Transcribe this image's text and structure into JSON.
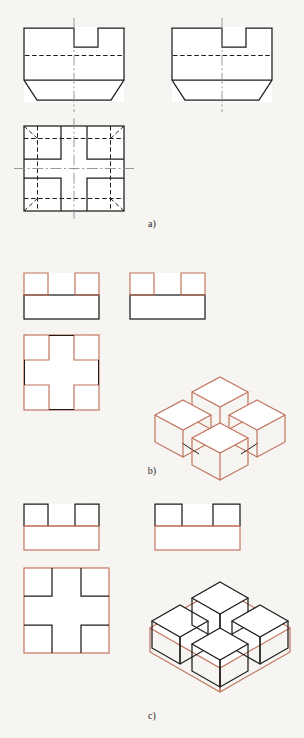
{
  "figure": {
    "background_color": "#f7f5f1",
    "line_color_solid": "#1d1d1d",
    "line_color_red": "#c0705c",
    "line_color_centerline": "#8c8c8c",
    "width": 304,
    "height": 738
  },
  "captions": {
    "a": "a)",
    "b": "b)",
    "c": "c)"
  },
  "panels": [
    {
      "id": "a",
      "label": "a)",
      "description": "Three orthographic views of a slotted chamfered block drawn in black with dashed hidden lines and dash-dot centrelines",
      "views": [
        {
          "name": "front-view",
          "position": "top-left",
          "style": "solid-black",
          "features": [
            "rectangular body",
            "central rectangular slot at top",
            "dashed hidden line across width",
            "chamfered lower corners",
            "vertical dash-dot centreline"
          ]
        },
        {
          "name": "side-view",
          "position": "top-right",
          "style": "solid-black",
          "features": [
            "rectangular body",
            "central rectangular slot at top",
            "dashed hidden line across width",
            "chamfered lower corners",
            "vertical dash-dot centreline"
          ]
        },
        {
          "name": "top-view",
          "position": "middle-left",
          "style": "solid-black",
          "features": [
            "square outline",
            "cross shaped solid cut lines",
            "dashed hidden chamfer lines at four corners",
            "horizontal and vertical dash-dot centrelines"
          ]
        }
      ]
    },
    {
      "id": "b",
      "label": "b)",
      "description": "Solution b: four cubes standing on top of a base slab; cubes drawn in red, base slab outline in black",
      "views": [
        {
          "name": "front-view",
          "position": "left",
          "style": "red-top-black-base",
          "features": [
            "two raised blocks on top",
            "solid base slab"
          ]
        },
        {
          "name": "side-view",
          "position": "right",
          "style": "red-top-black-base",
          "features": [
            "two raised blocks on top",
            "solid base slab"
          ]
        },
        {
          "name": "top-view",
          "position": "lower-left",
          "style": "red-outline-black-cross",
          "features": [
            "square with cross shaped channel"
          ]
        },
        {
          "name": "isometric-view",
          "position": "lower-right",
          "style": "red",
          "features": [
            "four cubes in diamond arrangement",
            "rear cube",
            "left cube",
            "right cube",
            "front cube"
          ]
        }
      ],
      "cube_count": 4
    },
    {
      "id": "c",
      "label": "c)",
      "description": "Solution c: a base slab with four cubic cavities; slab drawn in red, cavity edges in black",
      "views": [
        {
          "name": "front-view",
          "position": "left",
          "style": "black-top-red-base",
          "features": [
            "two raised blocks on top",
            "red base slab"
          ]
        },
        {
          "name": "side-view",
          "position": "right",
          "style": "black-top-red-base",
          "features": [
            "two raised blocks on top",
            "red base slab"
          ]
        },
        {
          "name": "top-view",
          "position": "lower-left",
          "style": "red-outline-black-cross",
          "features": [
            "square with cross shaped channel"
          ]
        },
        {
          "name": "isometric-view",
          "position": "lower-right",
          "style": "red-slab-black-cavities",
          "features": [
            "red base slab",
            "four cubic cavities in diamond arrangement"
          ]
        }
      ],
      "cavity_count": 4
    }
  ]
}
